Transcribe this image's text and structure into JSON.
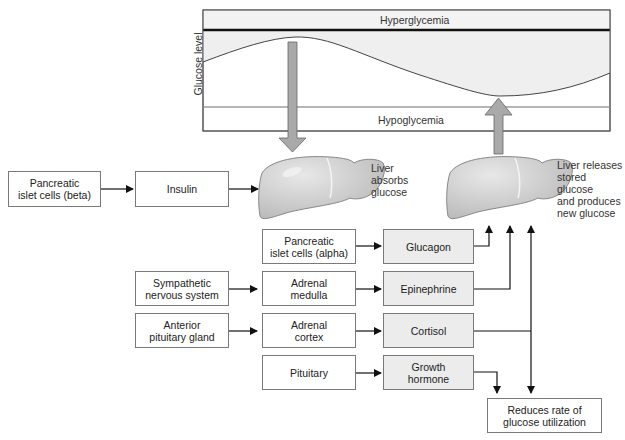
{
  "chart": {
    "y_axis_label": "Glucose level",
    "top_zone": "Hyperglycemia",
    "bottom_zone": "Hypoglycemia"
  },
  "livers": {
    "left_label": "Liver\nabsorbs\nglucose",
    "right_label": "Liver releases\nstored glucose\nand produces\nnew glucose"
  },
  "boxes": {
    "beta_cells": "Pancreatic\nislet cells (beta)",
    "insulin": "Insulin",
    "alpha_cells": "Pancreatic\nislet cells (alpha)",
    "glucagon": "Glucagon",
    "sympathetic": "Sympathetic\nnervous system",
    "adrenal_medulla": "Adrenal\nmedulla",
    "epinephrine": "Epinephrine",
    "anterior_pituitary": "Anterior\npituitary gland",
    "adrenal_cortex": "Adrenal\ncortex",
    "cortisol": "Cortisol",
    "pituitary": "Pituitary",
    "growth_hormone": "Growth\nhormone",
    "reduces_utilization": "Reduces rate of\nglucose utilization"
  },
  "colors": {
    "hyper_band": "#f3f3f3",
    "curve_fill": "#efefef",
    "liver_fill": "#cfcfcf",
    "arrow_fill": "#a9a9a9",
    "hormone_box": "#ececec"
  }
}
